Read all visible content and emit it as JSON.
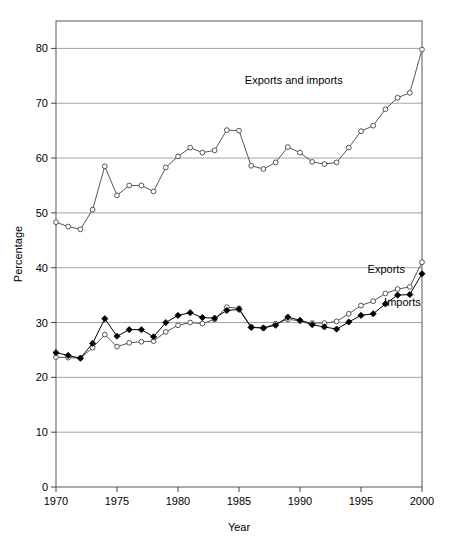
{
  "chart_data": {
    "type": "line",
    "title": "",
    "xlabel": "Year",
    "ylabel": "Percentage",
    "xlim": [
      1970,
      2000
    ],
    "ylim": [
      0,
      85
    ],
    "ytick_values": [
      0,
      10,
      20,
      30,
      40,
      50,
      60,
      70,
      80
    ],
    "ytick_labels": [
      "0",
      "10",
      "20",
      "30",
      "40",
      "50",
      "60",
      "70",
      "80"
    ],
    "xtick_values": [
      1970,
      1975,
      1980,
      1985,
      1990,
      1995,
      2000
    ],
    "xtick_labels": [
      "1970",
      "1975",
      "1980",
      "1985",
      "1990",
      "1995",
      "2000"
    ],
    "grid": "horizontal",
    "legend_position": "inline-annotations",
    "x": [
      1970,
      1971,
      1972,
      1973,
      1974,
      1975,
      1976,
      1977,
      1978,
      1979,
      1980,
      1981,
      1982,
      1983,
      1984,
      1985,
      1986,
      1987,
      1988,
      1989,
      1990,
      1991,
      1992,
      1993,
      1994,
      1995,
      1996,
      1997,
      1998,
      1999,
      2000
    ],
    "series": [
      {
        "name": "Exports and imports",
        "marker": "open-circle",
        "color": "#555555",
        "values": [
          48.3,
          47.5,
          47.0,
          50.6,
          58.5,
          53.2,
          55.0,
          55.0,
          53.9,
          58.3,
          60.3,
          61.9,
          61.0,
          61.4,
          65.1,
          65.0,
          58.6,
          58.0,
          59.2,
          62.0,
          61.0,
          59.3,
          58.9,
          59.2,
          61.9,
          64.9,
          65.9,
          68.9,
          71.0,
          71.9,
          79.8
        ]
      },
      {
        "name": "Exports",
        "marker": "open-circle",
        "color": "#555555",
        "values": [
          23.7,
          23.6,
          23.5,
          25.4,
          27.8,
          25.6,
          26.3,
          26.5,
          26.6,
          28.3,
          29.5,
          30.0,
          29.8,
          30.6,
          32.8,
          32.6,
          29.2,
          29.0,
          29.8,
          30.6,
          30.3,
          29.9,
          29.9,
          30.2,
          31.6,
          33.1,
          33.9,
          35.3,
          36.1,
          36.5,
          41.0
        ]
      },
      {
        "name": "Imports",
        "marker": "filled-diamond",
        "color": "#000000",
        "values": [
          24.5,
          24.0,
          23.5,
          26.2,
          30.7,
          27.5,
          28.7,
          28.7,
          27.4,
          30.0,
          31.3,
          31.8,
          30.9,
          30.8,
          32.2,
          32.4,
          29.1,
          29.0,
          29.5,
          31.0,
          30.4,
          29.6,
          29.2,
          28.8,
          30.1,
          31.3,
          31.6,
          33.4,
          35.0,
          35.1,
          38.9
        ]
      }
    ],
    "annotations": [
      {
        "text": "Exports and imports",
        "x": 1993.5,
        "y": 73.5,
        "anchor": "end",
        "name": "annotation-exports-and-imports"
      },
      {
        "text": "Exports",
        "x": 1998.6,
        "y": 39.0,
        "anchor": "end",
        "name": "annotation-exports"
      },
      {
        "text": "Imports",
        "x": 1999.9,
        "y": 33.0,
        "anchor": "end",
        "name": "annotation-imports"
      }
    ],
    "style": {
      "grid_color": "#999999",
      "frame_color": "#666666",
      "line_color": "#555555",
      "background": "#ffffff"
    }
  }
}
